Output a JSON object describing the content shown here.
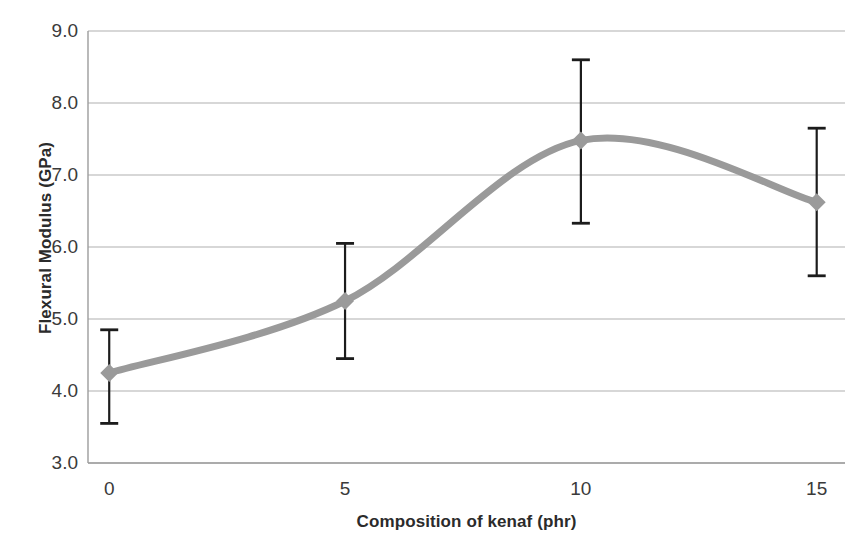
{
  "chart_data": {
    "type": "line",
    "title": "",
    "xlabel": "Composition of kenaf (phr)",
    "ylabel": "Flexural Modulus (GPa)",
    "x": [
      0,
      5,
      10,
      15
    ],
    "xtick_labels": [
      "0",
      "5",
      "10",
      "15"
    ],
    "ytick_labels": [
      "9.0",
      "8.0",
      "7.0",
      "6.0",
      "5.0",
      "4.0",
      "3.0"
    ],
    "ytick_values": [
      9.0,
      8.0,
      7.0,
      6.0,
      5.0,
      4.0,
      3.0
    ],
    "xlim": [
      -0.45,
      15.6
    ],
    "ylim": [
      3.0,
      9.0
    ],
    "grid": true,
    "legend": "none",
    "series": [
      {
        "name": "Flexural Modulus",
        "values": [
          4.25,
          5.25,
          7.48,
          6.62
        ],
        "smoothed": true,
        "line_color": "#9a9a9a",
        "marker": "diamond",
        "marker_color": "#9a9a9a",
        "error_upper": [
          4.85,
          6.05,
          8.6,
          7.65
        ],
        "error_lower": [
          3.55,
          4.45,
          6.33,
          5.6
        ],
        "errorbar_color": "#1c1c1c"
      }
    ]
  },
  "style": {
    "background": "#ffffff",
    "axis_color": "#9c9c9c",
    "grid_color": "#b0b0b0",
    "tick_text_color": "#3a3a3a",
    "title_text_color": "#2b2b2b"
  }
}
